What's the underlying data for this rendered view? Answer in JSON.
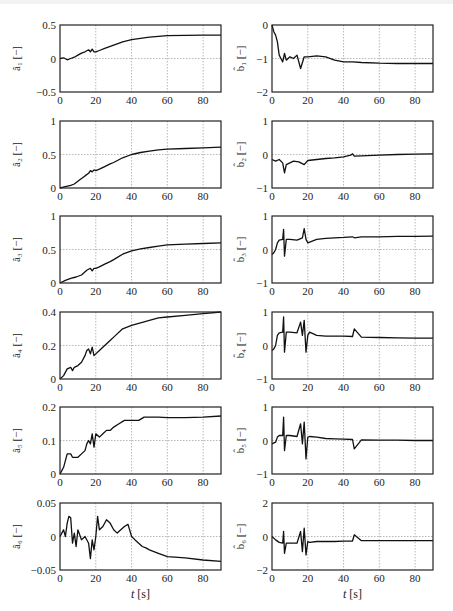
{
  "figure": {
    "x_axis_label": "t [s]",
    "layout": {
      "rows": 6,
      "cols": 2
    }
  },
  "chart_data": [
    {
      "id": "a1",
      "type": "line",
      "column": "left",
      "row": 0,
      "ylabel": "â₁ [−]",
      "xlabel": "",
      "xlim": [
        0,
        90
      ],
      "ylim": [
        -0.5,
        0.5
      ],
      "xticks": [
        0,
        20,
        40,
        60,
        80
      ],
      "yticks": [
        -0.5,
        0,
        0.5
      ],
      "ytick_labels": [
        "−0.5",
        "0",
        "0.5"
      ],
      "grid": true,
      "x": [
        0,
        2,
        4,
        6,
        8,
        10,
        12,
        14,
        16,
        17,
        18,
        19,
        20,
        22,
        25,
        30,
        35,
        40,
        45,
        50,
        55,
        60,
        70,
        80,
        90
      ],
      "y": [
        0,
        0.01,
        -0.02,
        0,
        0.02,
        0.05,
        0.08,
        0.1,
        0.13,
        0.1,
        0.14,
        0.1,
        0.1,
        0.12,
        0.15,
        0.2,
        0.25,
        0.28,
        0.3,
        0.32,
        0.33,
        0.34,
        0.345,
        0.35,
        0.35
      ]
    },
    {
      "id": "b1",
      "type": "line",
      "column": "right",
      "row": 0,
      "ylabel": "b̂₁ [−]",
      "xlabel": "",
      "xlim": [
        0,
        90
      ],
      "ylim": [
        -2,
        0
      ],
      "xticks": [
        0,
        20,
        40,
        60,
        80
      ],
      "yticks": [
        -2,
        -1,
        0
      ],
      "ytick_labels": [
        "−2",
        "−1",
        "0"
      ],
      "grid": true,
      "x": [
        0,
        1,
        2,
        3,
        4,
        5,
        6,
        7,
        8,
        10,
        12,
        14,
        16,
        18,
        20,
        25,
        30,
        35,
        40,
        45,
        50,
        60,
        70,
        80,
        90
      ],
      "y": [
        0,
        -0.2,
        -0.3,
        -0.5,
        -0.9,
        -1.0,
        -1.1,
        -0.85,
        -1.05,
        -0.95,
        -1.0,
        -0.9,
        -1.3,
        -0.95,
        -0.95,
        -0.92,
        -0.95,
        -1.05,
        -1.1,
        -1.1,
        -1.12,
        -1.14,
        -1.15,
        -1.15,
        -1.15
      ]
    },
    {
      "id": "a2",
      "type": "line",
      "column": "left",
      "row": 1,
      "ylabel": "â₂ [−]",
      "xlabel": "",
      "xlim": [
        0,
        90
      ],
      "ylim": [
        0,
        1
      ],
      "xticks": [
        0,
        20,
        40,
        60,
        80
      ],
      "yticks": [
        0,
        0.5,
        1
      ],
      "ytick_labels": [
        "0",
        "0.5",
        "1"
      ],
      "grid": true,
      "x": [
        0,
        3,
        6,
        8,
        10,
        12,
        14,
        16,
        17,
        18,
        19,
        20,
        22,
        25,
        28,
        30,
        35,
        40,
        45,
        50,
        55,
        60,
        70,
        80,
        90
      ],
      "y": [
        0,
        0.02,
        0.04,
        0.06,
        0.1,
        0.14,
        0.18,
        0.22,
        0.26,
        0.24,
        0.27,
        0.26,
        0.28,
        0.32,
        0.36,
        0.38,
        0.45,
        0.5,
        0.53,
        0.55,
        0.57,
        0.58,
        0.59,
        0.6,
        0.61
      ]
    },
    {
      "id": "b2",
      "type": "line",
      "column": "right",
      "row": 1,
      "ylabel": "b̂₂ [−]",
      "xlabel": "",
      "xlim": [
        0,
        90
      ],
      "ylim": [
        -1,
        1
      ],
      "xticks": [
        0,
        20,
        40,
        60,
        80
      ],
      "yticks": [
        -1,
        0,
        1
      ],
      "ytick_labels": [
        "−1",
        "0",
        "1"
      ],
      "grid": true,
      "x": [
        0,
        2,
        4,
        6,
        7,
        8,
        10,
        12,
        15,
        18,
        20,
        25,
        30,
        35,
        40,
        44,
        45,
        46,
        50,
        60,
        70,
        80,
        90
      ],
      "y": [
        -0.15,
        -0.2,
        -0.15,
        -0.25,
        -0.55,
        -0.3,
        -0.25,
        -0.2,
        -0.22,
        -0.3,
        -0.18,
        -0.15,
        -0.12,
        -0.1,
        -0.07,
        -0.02,
        0.02,
        -0.05,
        -0.04,
        -0.02,
        0.0,
        0.01,
        0.02
      ]
    },
    {
      "id": "a3",
      "type": "line",
      "column": "left",
      "row": 2,
      "ylabel": "â₃ [−]",
      "xlabel": "",
      "xlim": [
        0,
        90
      ],
      "ylim": [
        0,
        1
      ],
      "xticks": [
        0,
        20,
        40,
        60,
        80
      ],
      "yticks": [
        0,
        0.5,
        1
      ],
      "ytick_labels": [
        "0",
        "0.5",
        "1"
      ],
      "grid": true,
      "x": [
        0,
        3,
        6,
        9,
        12,
        15,
        17,
        18,
        19,
        20,
        22,
        25,
        28,
        30,
        35,
        40,
        45,
        50,
        55,
        60,
        70,
        80,
        90
      ],
      "y": [
        0,
        0.04,
        0.07,
        0.09,
        0.12,
        0.19,
        0.22,
        0.18,
        0.22,
        0.22,
        0.24,
        0.28,
        0.32,
        0.35,
        0.43,
        0.48,
        0.51,
        0.53,
        0.55,
        0.57,
        0.58,
        0.59,
        0.6
      ]
    },
    {
      "id": "b3",
      "type": "line",
      "column": "right",
      "row": 2,
      "ylabel": "b̂₃ [−]",
      "xlabel": "",
      "xlim": [
        0,
        90
      ],
      "ylim": [
        -1,
        1
      ],
      "xticks": [
        0,
        20,
        40,
        60,
        80
      ],
      "yticks": [
        -1,
        0,
        1
      ],
      "ytick_labels": [
        "−1",
        "0",
        "1"
      ],
      "grid": true,
      "x": [
        0,
        1,
        2,
        3,
        4,
        6,
        6.5,
        7,
        8,
        10,
        14,
        17,
        18,
        19,
        20,
        25,
        30,
        35,
        40,
        45,
        46,
        50,
        60,
        70,
        80,
        90
      ],
      "y": [
        -0.15,
        -0.1,
        0.0,
        0.2,
        0.28,
        0.3,
        0.6,
        -0.2,
        0.3,
        0.3,
        0.28,
        0.35,
        0.62,
        0.3,
        0.2,
        0.3,
        0.33,
        0.35,
        0.36,
        0.38,
        0.35,
        0.38,
        0.38,
        0.39,
        0.39,
        0.4
      ]
    },
    {
      "id": "a4",
      "type": "line",
      "column": "left",
      "row": 3,
      "ylabel": "â₄ [−]",
      "xlabel": "",
      "xlim": [
        0,
        90
      ],
      "ylim": [
        0,
        0.4
      ],
      "xticks": [
        0,
        20,
        40,
        60,
        80
      ],
      "yticks": [
        0,
        0.2,
        0.4
      ],
      "ytick_labels": [
        "0",
        "0.2",
        "0.4"
      ],
      "grid": true,
      "x": [
        0,
        2,
        4,
        6,
        7,
        8,
        10,
        12,
        14,
        15,
        16,
        17,
        18,
        19,
        20,
        22,
        25,
        28,
        30,
        35,
        40,
        45,
        50,
        55,
        60,
        70,
        80,
        90
      ],
      "y": [
        0,
        0.02,
        0.06,
        0.07,
        0.05,
        0.07,
        0.08,
        0.1,
        0.14,
        0.17,
        0.18,
        0.15,
        0.19,
        0.14,
        0.15,
        0.17,
        0.2,
        0.23,
        0.25,
        0.3,
        0.32,
        0.335,
        0.35,
        0.365,
        0.37,
        0.38,
        0.39,
        0.4
      ]
    },
    {
      "id": "b4",
      "type": "line",
      "column": "right",
      "row": 3,
      "ylabel": "b̂₄ [−]",
      "xlabel": "",
      "xlim": [
        0,
        90
      ],
      "ylim": [
        -1,
        1
      ],
      "xticks": [
        0,
        20,
        40,
        60,
        80
      ],
      "yticks": [
        -1,
        0,
        1
      ],
      "ytick_labels": [
        "−1",
        "0",
        "1"
      ],
      "grid": true,
      "x": [
        0,
        1,
        2,
        3,
        4,
        6,
        6.5,
        7,
        8,
        10,
        14,
        16,
        17,
        18,
        19,
        20,
        21,
        25,
        30,
        35,
        40,
        45,
        46,
        50,
        60,
        70,
        80,
        90
      ],
      "y": [
        -0.15,
        -0.1,
        0.0,
        0.3,
        0.38,
        0.4,
        0.85,
        -0.2,
        0.4,
        0.4,
        0.38,
        0.7,
        0.3,
        0.75,
        -0.2,
        0.3,
        0.4,
        0.3,
        0.28,
        0.28,
        0.28,
        0.27,
        0.5,
        0.25,
        0.24,
        0.23,
        0.22,
        0.22
      ]
    },
    {
      "id": "a5",
      "type": "line",
      "column": "left",
      "row": 4,
      "ylabel": "â₅ [−]",
      "xlabel": "",
      "xlim": [
        0,
        90
      ],
      "ylim": [
        0,
        0.2
      ],
      "xticks": [
        0,
        20,
        40,
        60,
        80
      ],
      "yticks": [
        0,
        0.1,
        0.2
      ],
      "ytick_labels": [
        "0",
        "0.1",
        "0.2"
      ],
      "grid": true,
      "x": [
        0,
        1,
        2,
        4,
        6,
        7,
        8,
        10,
        12,
        14,
        15,
        16,
        17,
        18,
        19,
        20,
        22,
        24,
        26,
        28,
        30,
        33,
        36,
        40,
        44,
        47,
        50,
        55,
        60,
        70,
        80,
        90
      ],
      "y": [
        0,
        0.01,
        0.02,
        0.06,
        0.06,
        0.05,
        0.05,
        0.05,
        0.06,
        0.07,
        0.09,
        0.1,
        0.09,
        0.12,
        0.08,
        0.12,
        0.11,
        0.12,
        0.13,
        0.13,
        0.14,
        0.15,
        0.16,
        0.16,
        0.16,
        0.17,
        0.17,
        0.17,
        0.168,
        0.168,
        0.17,
        0.173
      ]
    },
    {
      "id": "b5",
      "type": "line",
      "column": "right",
      "row": 4,
      "ylabel": "b̂₅ [−]",
      "xlabel": "",
      "xlim": [
        0,
        90
      ],
      "ylim": [
        -1,
        1
      ],
      "xticks": [
        0,
        20,
        40,
        60,
        80
      ],
      "yticks": [
        -1,
        0,
        1
      ],
      "ytick_labels": [
        "−1",
        "0",
        "1"
      ],
      "grid": true,
      "x": [
        0,
        2,
        3,
        4,
        6,
        6.5,
        7,
        8,
        10,
        14,
        16,
        17,
        18,
        19,
        20,
        21,
        25,
        30,
        35,
        40,
        45,
        46,
        50,
        60,
        70,
        80,
        90
      ],
      "y": [
        -0.1,
        -0.05,
        0.1,
        0.15,
        0.15,
        0.7,
        -0.3,
        0.15,
        0.15,
        0.12,
        0.5,
        -0.1,
        0.55,
        -0.55,
        0.1,
        0.12,
        0.1,
        0.06,
        0.05,
        0.04,
        0.03,
        -0.25,
        0.02,
        0.01,
        0.01,
        0.0,
        0.0
      ]
    },
    {
      "id": "a6",
      "type": "line",
      "column": "left",
      "row": 5,
      "ylabel": "â₆ [−]",
      "xlabel": "t [s]",
      "xlim": [
        0,
        90
      ],
      "ylim": [
        -0.05,
        0.05
      ],
      "xticks": [
        0,
        20,
        40,
        60,
        80
      ],
      "yticks": [
        -0.05,
        0,
        0.05
      ],
      "ytick_labels": [
        "−0.05",
        "0",
        "0.05"
      ],
      "grid": true,
      "x": [
        0,
        1,
        2,
        3,
        4,
        5,
        6,
        7,
        8,
        9,
        10,
        12,
        14,
        16,
        17,
        18,
        19,
        20,
        21,
        22,
        24,
        26,
        28,
        30,
        32,
        34,
        36,
        38,
        40,
        42,
        44,
        46,
        48,
        50,
        55,
        60,
        70,
        80,
        90
      ],
      "y": [
        0,
        0.005,
        0.01,
        0.0,
        0.02,
        0.03,
        0.028,
        -0.01,
        0.005,
        -0.015,
        0.01,
        -0.005,
        0.0,
        -0.01,
        -0.033,
        -0.005,
        -0.02,
        0.0,
        0.03,
        0.01,
        0.015,
        0.025,
        0.02,
        0.01,
        0.005,
        0.01,
        0.015,
        0.018,
        0.0,
        -0.005,
        -0.01,
        -0.015,
        -0.017,
        -0.02,
        -0.025,
        -0.03,
        -0.032,
        -0.035,
        -0.037
      ]
    },
    {
      "id": "b6",
      "type": "line",
      "column": "right",
      "row": 5,
      "ylabel": "b̂₆ [−]",
      "xlabel": "t [s]",
      "xlim": [
        0,
        90
      ],
      "ylim": [
        -2,
        2
      ],
      "xticks": [
        0,
        20,
        40,
        60,
        80
      ],
      "yticks": [
        -2,
        0,
        2
      ],
      "ytick_labels": [
        "−2",
        "0",
        "2"
      ],
      "grid": true,
      "x": [
        0,
        2,
        4,
        6,
        6.5,
        7,
        8,
        10,
        14,
        16,
        17,
        18,
        19,
        20,
        21,
        25,
        30,
        35,
        40,
        45,
        46,
        50,
        60,
        70,
        80,
        90
      ],
      "y": [
        0,
        -0.2,
        -0.35,
        -0.4,
        0.3,
        -1.0,
        -0.4,
        -0.4,
        -0.4,
        0.3,
        -0.9,
        0.5,
        -1.1,
        -0.3,
        -0.35,
        -0.3,
        -0.3,
        -0.3,
        -0.28,
        -0.27,
        0.1,
        -0.25,
        -0.25,
        -0.25,
        -0.25,
        -0.25
      ]
    }
  ]
}
